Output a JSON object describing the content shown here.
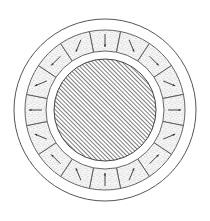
{
  "diagram": {
    "type": "cross-section",
    "center": [
      105,
      110
    ],
    "outer_housing_radius": 91,
    "segment_ring_outer_radius": 80,
    "segment_ring_inner_radius": 59,
    "core_radius": 51,
    "segment_count": 16,
    "segment_angle_offset_deg": -11.25,
    "hatch_spacing": 3,
    "hatch_angle_deg": -45,
    "colors": {
      "line": "#555555",
      "hatch": "#444444",
      "stipple": "#9a9a9a",
      "background": "#ffffff"
    },
    "segments": [
      {
        "index": 0,
        "center_deg": 0,
        "arrow_deg": 180
      },
      {
        "index": 1,
        "center_deg": 22.5,
        "arrow_deg": 157.5
      },
      {
        "index": 2,
        "center_deg": 45,
        "arrow_deg": 135
      },
      {
        "index": 3,
        "center_deg": 67.5,
        "arrow_deg": 112.5
      },
      {
        "index": 4,
        "center_deg": 90,
        "arrow_deg": 90
      },
      {
        "index": 5,
        "center_deg": 112.5,
        "arrow_deg": 67.5
      },
      {
        "index": 6,
        "center_deg": 135,
        "arrow_deg": 45
      },
      {
        "index": 7,
        "center_deg": 157.5,
        "arrow_deg": 22.5
      },
      {
        "index": 8,
        "center_deg": 180,
        "arrow_deg": 0
      },
      {
        "index": 9,
        "center_deg": 202.5,
        "arrow_deg": -22.5
      },
      {
        "index": 10,
        "center_deg": 225,
        "arrow_deg": -45
      },
      {
        "index": 11,
        "center_deg": 247.5,
        "arrow_deg": -67.5
      },
      {
        "index": 12,
        "center_deg": 270,
        "arrow_deg": -90
      },
      {
        "index": 13,
        "center_deg": 292.5,
        "arrow_deg": -112.5
      },
      {
        "index": 14,
        "center_deg": 315,
        "arrow_deg": -135
      },
      {
        "index": 15,
        "center_deg": 337.5,
        "arrow_deg": -157.5
      }
    ]
  }
}
